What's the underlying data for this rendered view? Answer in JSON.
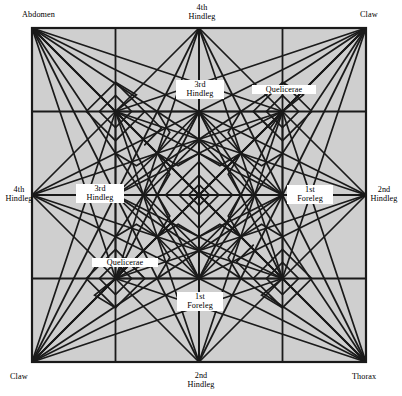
{
  "figure": {
    "kind": "origami-crease-pattern",
    "paper": {
      "fill": "#cfcfcf",
      "border_color": "#1a1a1a",
      "x": 32,
      "y": 28,
      "size": 334
    },
    "line_color": "#1a1a1a",
    "background": "#ffffff"
  },
  "labels": {
    "corner_top_left": "Abdomen",
    "corner_top_right": "Claw",
    "corner_bottom_left": "Claw",
    "corner_bottom_right": "Thorax",
    "edge_top": "4th\nHindleg",
    "edge_left": "4th\nHindleg",
    "edge_right": "2nd\nHindleg",
    "edge_bottom": "2nd\nHindleg",
    "inner_top": "3rd\nHindleg",
    "inner_left": "3rd\nHindleg",
    "inner_right": "1st\nForeleg",
    "inner_bottom": "1st\nForeleg",
    "inner_upper_right": "Quelicerae",
    "inner_lower_left": "Quelicerae"
  },
  "label_positions": {
    "corner_top_left": {
      "x": 22,
      "y": 10,
      "w": 60,
      "align": "left"
    },
    "corner_top_right": {
      "x": 360,
      "y": 10,
      "w": 40,
      "align": "left"
    },
    "corner_bottom_left": {
      "x": 10,
      "y": 372,
      "w": 40,
      "align": "left"
    },
    "corner_bottom_right": {
      "x": 352,
      "y": 372,
      "w": 48,
      "align": "left"
    },
    "edge_top": {
      "x": 174,
      "y": 3,
      "w": 56,
      "align": "center"
    },
    "edge_left": {
      "x": 2,
      "y": 185,
      "w": 34,
      "align": "center"
    },
    "edge_right": {
      "x": 366,
      "y": 185,
      "w": 36,
      "align": "center"
    },
    "edge_bottom": {
      "x": 172,
      "y": 371,
      "w": 58,
      "align": "center"
    },
    "inner_top": {
      "x": 176,
      "y": 80,
      "w": 44,
      "align": "center"
    },
    "inner_left": {
      "x": 76,
      "y": 184,
      "w": 44,
      "align": "center"
    },
    "inner_right": {
      "x": 287,
      "y": 185,
      "w": 42,
      "align": "center"
    },
    "inner_bottom": {
      "x": 177,
      "y": 292,
      "w": 42,
      "align": "center"
    },
    "inner_upper_right": {
      "x": 252,
      "y": 85,
      "w": 60,
      "align": "center"
    },
    "inner_lower_left": {
      "x": 92,
      "y": 258,
      "w": 62,
      "align": "center"
    }
  },
  "nodes": {
    "corners": [
      "Abdomen",
      "Claw",
      "Claw",
      "Thorax"
    ],
    "edge_midpoints": [
      "4th Hindleg",
      "4th Hindleg",
      "2nd Hindleg",
      "2nd Hindleg"
    ],
    "major_interior": [
      "3rd Hindleg",
      "3rd Hindleg",
      "1st Foreleg",
      "1st Foreleg"
    ],
    "minor_interior": [
      "Quelicerae",
      "Quelicerae"
    ]
  }
}
